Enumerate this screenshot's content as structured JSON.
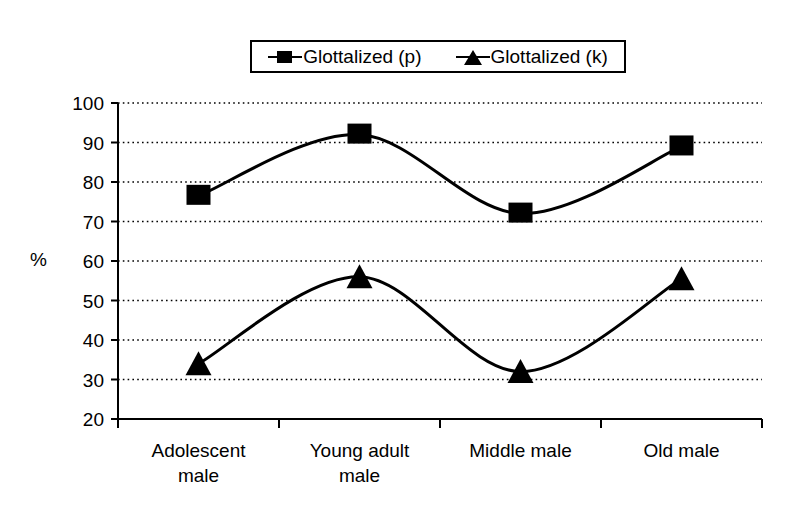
{
  "legend": {
    "position": "top-center",
    "entries": [
      {
        "label": "Glottalized (p)",
        "marker": "square-marker-icon"
      },
      {
        "label": "Glottalized (k)",
        "marker": "triangle-marker-icon"
      }
    ]
  },
  "axis": {
    "y_label": "%",
    "y_ticks": [
      "100",
      "90",
      "80",
      "70",
      "60",
      "50",
      "40",
      "30",
      "20"
    ],
    "x_categories": [
      [
        "Adolescent",
        "male"
      ],
      [
        "Young adult",
        "male"
      ],
      [
        "Middle male",
        ""
      ],
      [
        "Old male",
        ""
      ]
    ]
  },
  "colors": {
    "line": "#000000",
    "marker": "#000000",
    "gridline": "#000000",
    "axis": "#000000",
    "background": "#ffffff"
  },
  "chart_data": {
    "type": "line",
    "title": "",
    "xlabel": "",
    "ylabel": "%",
    "ylim": [
      20,
      100
    ],
    "ytick_step": 10,
    "grid": "horizontal-dotted",
    "legend_position": "top-center",
    "smoothed": true,
    "categories": [
      "Adolescent male",
      "Young adult male",
      "Middle male",
      "Old male"
    ],
    "series": [
      {
        "name": "Glottalized (p)",
        "marker": "square",
        "values": [
          76.5,
          92,
          72,
          89
        ]
      },
      {
        "name": "Glottalized (k)",
        "marker": "triangle",
        "values": [
          34,
          56,
          32,
          55.5
        ]
      }
    ]
  }
}
